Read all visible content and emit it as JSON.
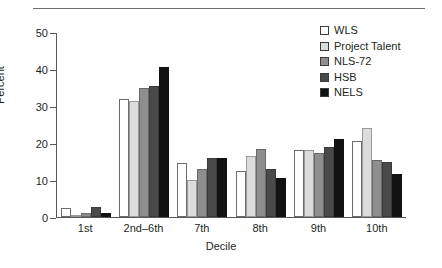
{
  "chart_data": {
    "type": "bar",
    "title": "",
    "xlabel": "Decile",
    "ylabel": "Percent",
    "ylim": [
      0,
      50
    ],
    "yticks": [
      0,
      10,
      20,
      30,
      40,
      50
    ],
    "grid": false,
    "legend_position": "top-right",
    "categories": [
      "1st",
      "2nd–6th",
      "7th",
      "8th",
      "9th",
      "10th"
    ],
    "series": [
      {
        "name": "WLS",
        "color": "#ffffff",
        "values": [
          2.5,
          31.9,
          14.5,
          12.5,
          18.0,
          20.5
        ]
      },
      {
        "name": "Project Talent",
        "color": "#dcdcdc",
        "values": [
          0.6,
          31.3,
          10.0,
          16.5,
          18.0,
          24.0
        ]
      },
      {
        "name": "NLS-72",
        "color": "#8e8e8e",
        "values": [
          1.0,
          35.0,
          13.0,
          18.5,
          17.2,
          15.5
        ]
      },
      {
        "name": "HSB",
        "color": "#4a4a4a",
        "values": [
          2.6,
          35.5,
          16.0,
          13.0,
          19.0,
          15.0
        ]
      },
      {
        "name": "NELS",
        "color": "#121212",
        "values": [
          1.1,
          40.5,
          16.0,
          10.5,
          21.0,
          11.5
        ]
      }
    ]
  },
  "legend": {
    "entries": [
      {
        "label": "WLS"
      },
      {
        "label": "Project Talent"
      },
      {
        "label": "NLS-72"
      },
      {
        "label": "HSB"
      },
      {
        "label": "NELS"
      }
    ]
  },
  "axes": {
    "y_title": "Percent",
    "x_title": "Decile",
    "y_tick_labels": [
      "50",
      "40",
      "30",
      "20",
      "10",
      "0"
    ],
    "x_tick_labels": [
      "1st",
      "2nd–6th",
      "7th",
      "8th",
      "9th",
      "10th"
    ]
  }
}
